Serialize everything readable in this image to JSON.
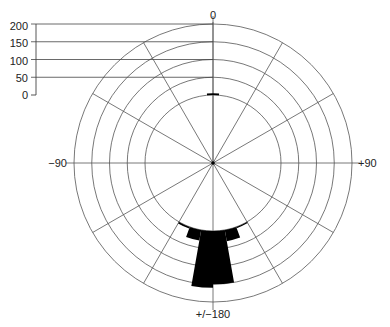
{
  "chart_data": {
    "type": "polar-bar",
    "title": "",
    "angle_labels": [
      {
        "text": "0",
        "angle": 0
      },
      {
        "text": "+90",
        "angle": 90
      },
      {
        "text": "+/−180",
        "angle": 180
      },
      {
        "text": "−90",
        "angle": 270
      }
    ],
    "radial_scale": {
      "ticks": [
        "200",
        "150",
        "100",
        "50",
        "0"
      ],
      "values": [
        200,
        150,
        100,
        50,
        0
      ],
      "range": [
        0,
        200
      ]
    },
    "spoke_interval_deg": 30,
    "grid": true,
    "bin_width_deg": 10,
    "bars": [
      {
        "start": 355,
        "end": 5,
        "value": 5
      },
      {
        "start": 150,
        "end": 160,
        "value": 4
      },
      {
        "start": 160,
        "end": 170,
        "value": 32
      },
      {
        "start": 170,
        "end": 180,
        "value": 150
      },
      {
        "start": 180,
        "end": 190,
        "value": 160
      },
      {
        "start": 190,
        "end": 200,
        "value": 30
      },
      {
        "start": 200,
        "end": 210,
        "value": 5
      }
    ],
    "colors": {
      "bars": "#000000",
      "grid": "#555555",
      "text": "#222222"
    }
  }
}
